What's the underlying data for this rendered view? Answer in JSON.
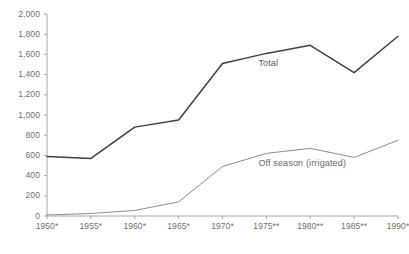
{
  "header": {
    "cropped_text": ""
  },
  "chart_data": {
    "type": "line",
    "title": "",
    "subtitle": "",
    "xlabel": "",
    "ylabel": "",
    "categories": [
      "1950*",
      "1955*",
      "1960*",
      "1965*",
      "1970*",
      "1975**",
      "1980**",
      "1985**",
      "1990*"
    ],
    "series": [
      {
        "name": "Total",
        "color": "#404040",
        "values": [
          590,
          570,
          880,
          950,
          1510,
          1610,
          1690,
          1420,
          1780
        ]
      },
      {
        "name": "Off season (irrigated)",
        "color": "#8c8c8c",
        "values": [
          10,
          25,
          55,
          140,
          490,
          620,
          670,
          580,
          750
        ]
      }
    ],
    "ylim": [
      0,
      2000
    ],
    "ytick_labels": [
      "2,000",
      "1,800",
      "1,600",
      "1,400",
      "1,200",
      "1,000",
      "800",
      "600",
      "400",
      "200",
      "0"
    ],
    "ytick_values": [
      2000,
      1800,
      1600,
      1400,
      1200,
      1000,
      800,
      600,
      400,
      200,
      0
    ],
    "grid": false,
    "legend_position": "inline-annotations",
    "annotations": [
      {
        "text": "Total",
        "series": "Total",
        "x_index": 5,
        "value": 1610
      },
      {
        "text": "Off season (irrigated)",
        "series": "Off season (irrigated)",
        "x_index": 5,
        "value": 620
      }
    ],
    "axis_color": "#a6a6a6"
  }
}
